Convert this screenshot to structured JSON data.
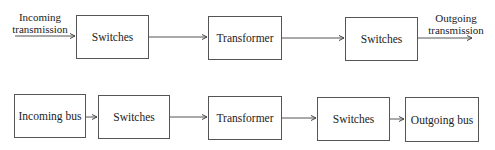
{
  "diagram": {
    "row1": {
      "input_label": [
        "Incoming",
        "transmission"
      ],
      "output_label": [
        "Outgoing",
        "transmission"
      ],
      "boxes": [
        {
          "label": "Switches"
        },
        {
          "label": "Transformer"
        },
        {
          "label": "Switches"
        }
      ]
    },
    "row2": {
      "boxes": [
        {
          "label": "Incoming bus"
        },
        {
          "label": "Switches"
        },
        {
          "label": "Transformer"
        },
        {
          "label": "Switches"
        },
        {
          "label": "Outgoing bus"
        }
      ]
    },
    "colors": {
      "stroke": "#555555",
      "text": "#222222",
      "background": "#ffffff"
    }
  }
}
